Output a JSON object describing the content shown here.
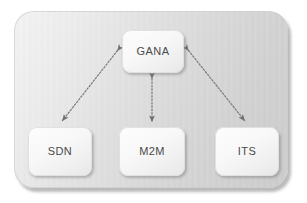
{
  "diagram": {
    "panel": {
      "name": "container-panel",
      "fill_start": "#f3f3f3",
      "fill_end": "#cccccc"
    },
    "nodes": [
      {
        "id": "gana",
        "label": "GANA",
        "x": 122,
        "y": 30,
        "w": 62,
        "h": 43
      },
      {
        "id": "sdn",
        "label": "SDN",
        "x": 28,
        "y": 127,
        "w": 64,
        "h": 49
      },
      {
        "id": "m2m",
        "label": "M2M",
        "x": 119,
        "y": 127,
        "w": 66,
        "h": 49
      },
      {
        "id": "its",
        "label": "ITS",
        "x": 215,
        "y": 127,
        "w": 64,
        "h": 49
      }
    ],
    "edges": [
      {
        "id": "gana-sdn",
        "from": "gana",
        "to": "sdn",
        "style": "dotted",
        "direction": "bidirectional",
        "color": "#7c7c7c"
      },
      {
        "id": "gana-m2m",
        "from": "gana",
        "to": "m2m",
        "style": "dotted",
        "direction": "bidirectional",
        "color": "#7c7c7c"
      },
      {
        "id": "gana-its",
        "from": "gana",
        "to": "its",
        "style": "dotted",
        "direction": "bidirectional",
        "color": "#7c7c7c"
      }
    ],
    "edge_color": "#7c7c7c",
    "text_color": "#4a4a4a"
  }
}
